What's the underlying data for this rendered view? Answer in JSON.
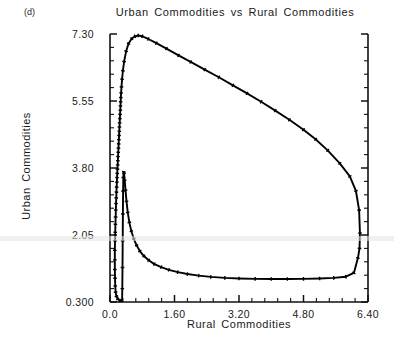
{
  "figure": {
    "panel_label": "(d)",
    "background_color": "#ffffff",
    "line_color": "#000000",
    "axis_color": "#111111"
  },
  "chart_data": {
    "type": "line",
    "title": "Urban Commodities vs Rural Commodities",
    "xlabel": "Rural Commodities",
    "ylabel": "Urban Commodities",
    "xlim": [
      0.0,
      6.4
    ],
    "ylim": [
      0.3,
      7.3
    ],
    "grid": false,
    "legend": null,
    "xticks": [
      0.0,
      1.6,
      3.2,
      4.8,
      6.4
    ],
    "xtick_labels": [
      "0.0",
      "1.60",
      "3.20",
      "4.80",
      "6.40"
    ],
    "yticks": [
      0.3,
      2.05,
      3.8,
      5.55,
      7.3
    ],
    "ytick_labels": [
      "0.300",
      "2.05",
      "3.80",
      "5.55",
      "7.30"
    ],
    "x_minor_per_major": 4,
    "y_minor_per_major": 4,
    "series": [
      {
        "name": "limit-cycle-trajectory",
        "marker": "tick",
        "closed": true,
        "x": [
          0.3,
          0.24,
          0.19,
          0.16,
          0.14,
          0.13,
          0.125,
          0.12,
          0.12,
          0.12,
          0.125,
          0.13,
          0.135,
          0.14,
          0.145,
          0.15,
          0.155,
          0.16,
          0.165,
          0.17,
          0.175,
          0.18,
          0.185,
          0.19,
          0.195,
          0.2,
          0.205,
          0.21,
          0.215,
          0.22,
          0.225,
          0.23,
          0.235,
          0.24,
          0.245,
          0.25,
          0.255,
          0.26,
          0.265,
          0.27,
          0.275,
          0.285,
          0.3,
          0.32,
          0.35,
          0.4,
          0.46,
          0.54,
          0.62,
          0.7,
          0.8,
          0.95,
          1.15,
          1.4,
          1.7,
          2.0,
          2.35,
          2.7,
          3.05,
          3.4,
          3.75,
          4.1,
          4.45,
          4.8,
          5.1,
          5.4,
          5.7,
          5.95,
          6.1,
          6.18,
          6.2,
          6.19,
          6.15,
          6.05,
          5.85,
          5.55,
          5.2,
          4.8,
          4.4,
          4.0,
          3.6,
          3.2,
          2.85,
          2.5,
          2.2,
          1.92,
          1.68,
          1.46,
          1.27,
          1.1,
          0.96,
          0.84,
          0.74,
          0.66,
          0.59,
          0.53,
          0.48,
          0.44,
          0.41,
          0.385,
          0.365,
          0.35,
          0.34,
          0.33,
          0.325,
          0.32,
          0.315,
          0.31,
          0.305,
          0.3
        ],
        "y": [
          0.32,
          0.34,
          0.38,
          0.45,
          0.56,
          0.72,
          0.92,
          1.15,
          1.4,
          1.65,
          1.9,
          2.12,
          2.33,
          2.52,
          2.7,
          2.87,
          3.02,
          3.17,
          3.3,
          3.43,
          3.55,
          3.66,
          3.77,
          3.88,
          3.99,
          4.1,
          4.21,
          4.32,
          4.43,
          4.54,
          4.65,
          4.76,
          4.87,
          4.98,
          5.09,
          5.2,
          5.31,
          5.42,
          5.53,
          5.64,
          5.76,
          5.92,
          6.12,
          6.34,
          6.58,
          6.85,
          7.05,
          7.18,
          7.24,
          7.26,
          7.24,
          7.17,
          7.06,
          6.92,
          6.74,
          6.57,
          6.37,
          6.17,
          5.96,
          5.75,
          5.53,
          5.3,
          5.06,
          4.8,
          4.55,
          4.26,
          3.92,
          3.58,
          3.2,
          2.7,
          2.1,
          1.7,
          1.45,
          1.06,
          0.96,
          0.93,
          0.915,
          0.905,
          0.9,
          0.9,
          0.905,
          0.915,
          0.93,
          0.955,
          0.99,
          1.03,
          1.08,
          1.14,
          1.21,
          1.29,
          1.39,
          1.5,
          1.63,
          1.78,
          1.95,
          2.15,
          2.38,
          2.64,
          2.93,
          3.22,
          3.48,
          3.66,
          3.7,
          3.55,
          3.2,
          2.6,
          1.9,
          1.2,
          0.65,
          0.32
        ]
      }
    ]
  }
}
